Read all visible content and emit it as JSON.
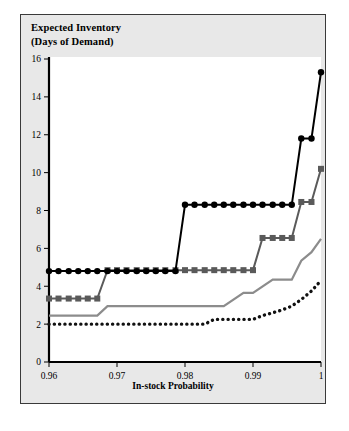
{
  "figure": {
    "title_line1": "Expected Inventory",
    "title_line2": "(Days of Demand)",
    "background_color": "#e8e8e8",
    "plot_background_color": "#ffffff",
    "border_color": "#3a3a3a"
  },
  "chart_data": {
    "type": "line",
    "title": "Expected Inventory (Days of Demand)",
    "xlabel": "In-stock Probability",
    "ylabel": "Expected Inventory (Days of Demand)",
    "xlim": [
      0.96,
      1.0
    ],
    "ylim": [
      0,
      16
    ],
    "xticks": [
      0.96,
      0.97,
      0.98,
      0.99,
      1.0
    ],
    "xtick_labels": [
      "0.96",
      "0.97",
      "0.98",
      "0.99",
      "1"
    ],
    "yticks": [
      0,
      2,
      4,
      6,
      8,
      10,
      12,
      14,
      16
    ],
    "ytick_labels": [
      "0",
      "2",
      "4",
      "6",
      "8",
      "10",
      "12",
      "14",
      "16"
    ],
    "grid": false,
    "legend": false,
    "legend_position": "none",
    "series": [
      {
        "name": "black-circle-series",
        "marker": "circle",
        "line_style": "solid",
        "color": "#000000",
        "x": [
          0.96,
          0.9614,
          0.9629,
          0.9643,
          0.9657,
          0.9671,
          0.9686,
          0.97,
          0.9714,
          0.9729,
          0.9743,
          0.9757,
          0.9771,
          0.9786,
          0.98,
          0.9814,
          0.9829,
          0.9843,
          0.9857,
          0.9871,
          0.9886,
          0.99,
          0.9914,
          0.9929,
          0.9943,
          0.9957,
          0.9971,
          0.9986,
          1.0
        ],
        "y": [
          4.8,
          4.8,
          4.8,
          4.8,
          4.8,
          4.8,
          4.8,
          4.8,
          4.8,
          4.8,
          4.8,
          4.8,
          4.8,
          4.8,
          8.3,
          8.3,
          8.3,
          8.3,
          8.3,
          8.3,
          8.3,
          8.3,
          8.3,
          8.3,
          8.3,
          8.3,
          11.8,
          11.8,
          15.3
        ]
      },
      {
        "name": "dark-gray-square-series",
        "marker": "square",
        "line_style": "solid",
        "color": "#5a5a5a",
        "x": [
          0.96,
          0.9614,
          0.9629,
          0.9643,
          0.9657,
          0.9671,
          0.9686,
          0.97,
          0.9714,
          0.9729,
          0.9743,
          0.9757,
          0.9771,
          0.9786,
          0.98,
          0.9814,
          0.9829,
          0.9843,
          0.9857,
          0.9871,
          0.9886,
          0.99,
          0.9914,
          0.9929,
          0.9943,
          0.9957,
          0.9971,
          0.9986,
          1.0
        ],
        "y": [
          3.35,
          3.35,
          3.35,
          3.35,
          3.35,
          3.35,
          4.85,
          4.85,
          4.85,
          4.85,
          4.85,
          4.85,
          4.85,
          4.85,
          4.85,
          4.85,
          4.85,
          4.85,
          4.85,
          4.85,
          4.85,
          4.85,
          6.55,
          6.55,
          6.55,
          6.55,
          8.45,
          8.45,
          10.2
        ]
      },
      {
        "name": "light-gray-line-series",
        "marker": "none",
        "line_style": "solid",
        "color": "#8c8c8c",
        "x": [
          0.96,
          0.9629,
          0.9657,
          0.9671,
          0.9686,
          0.97,
          0.98,
          0.9857,
          0.9886,
          0.99,
          0.9929,
          0.9943,
          0.9957,
          0.9971,
          0.9986,
          1.0
        ],
        "y": [
          2.45,
          2.45,
          2.45,
          2.45,
          2.95,
          2.95,
          2.95,
          2.95,
          3.65,
          3.65,
          4.35,
          4.35,
          4.35,
          5.35,
          5.8,
          6.5
        ]
      },
      {
        "name": "black-dotted-series",
        "marker": "none",
        "line_style": "dotted",
        "color": "#111111",
        "x": [
          0.96,
          0.97,
          0.98,
          0.9829,
          0.9843,
          0.9871,
          0.99,
          0.9914,
          0.9929,
          0.9943,
          0.9957,
          0.9971,
          0.9986,
          1.0
        ],
        "y": [
          2.0,
          2.0,
          2.0,
          2.0,
          2.25,
          2.25,
          2.25,
          2.45,
          2.6,
          2.75,
          2.95,
          3.3,
          3.75,
          4.3
        ]
      }
    ]
  },
  "axes": {
    "x_axis_label": "In-stock Probability",
    "x_tick_labels": [
      "0.96",
      "0.97",
      "0.98",
      "0.99",
      "1"
    ],
    "y_tick_labels": [
      "0",
      "2",
      "4",
      "6",
      "8",
      "10",
      "12",
      "14",
      "16"
    ]
  }
}
